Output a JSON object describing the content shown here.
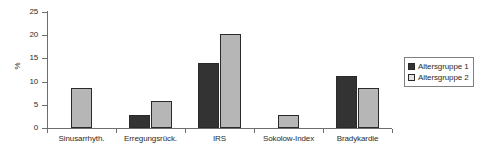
{
  "chart_data": {
    "type": "bar",
    "title": "",
    "xlabel": "",
    "ylabel": "%",
    "ylim": [
      0,
      25
    ],
    "yticks": [
      0,
      5,
      10,
      15,
      20,
      25
    ],
    "grid": false,
    "legend_position": "right",
    "categories": [
      "Sinusarrhyth.",
      "Erregungsrück.",
      "IRS",
      "Sokolow-Index",
      "Bradykardie"
    ],
    "series": [
      {
        "name": "Altersgruppe 1",
        "color": "#333333",
        "values": [
          0,
          2.9,
          14.0,
          0,
          11.2
        ]
      },
      {
        "name": "Altersgruppe 2",
        "color": "#b6b6b6",
        "values": [
          8.7,
          5.8,
          20.3,
          2.9,
          8.6
        ]
      }
    ]
  },
  "axis": {
    "y_label": "%",
    "tick_labels": [
      "0",
      "5",
      "10",
      "15",
      "20",
      "25"
    ]
  },
  "legend": {
    "entries": [
      {
        "label": "Altersgruppe 1",
        "swatch": "dark-square-icon"
      },
      {
        "label": "Altersgruppe 2",
        "swatch": "light-square-icon"
      }
    ]
  }
}
